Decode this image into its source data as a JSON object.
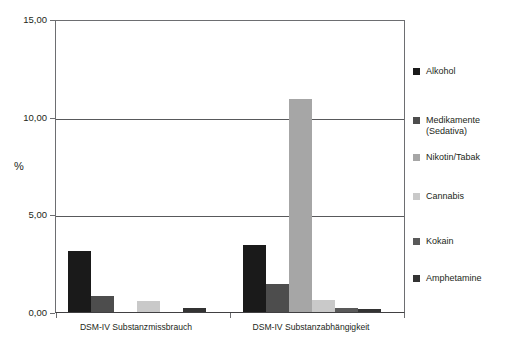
{
  "chart_data": {
    "type": "bar",
    "title": "",
    "xlabel": "",
    "ylabel": "%",
    "ylim": [
      0,
      15
    ],
    "yticks": [
      0,
      5,
      10,
      15
    ],
    "ytick_labels": [
      "0,00",
      "5,00",
      "10,00",
      "15,00"
    ],
    "grid": true,
    "legend_position": "right",
    "categories": [
      "DSM-IV Substanzmissbrauch",
      "DSM-IV Substanzabhängigkeit"
    ],
    "series": [
      {
        "name": "Alkohol",
        "color": "#1a1a1a",
        "values": [
          3.1,
          3.45
        ]
      },
      {
        "name": "Medikamente\n(Sedativa)",
        "color": "#4d4d4d",
        "values": [
          0.8,
          1.45
        ]
      },
      {
        "name": "Nikotin/Tabak",
        "color": "#a6a6a6",
        "values": [
          0.0,
          10.9
        ]
      },
      {
        "name": "Cannabis",
        "color": "#c9c9c9",
        "values": [
          0.55,
          0.6
        ]
      },
      {
        "name": "Kokain",
        "color": "#595959",
        "values": [
          0.0,
          0.22
        ]
      },
      {
        "name": "Amphetamine",
        "color": "#333333",
        "values": [
          0.2,
          0.15
        ]
      }
    ]
  },
  "axis": {
    "y_title": "%",
    "ticks": [
      {
        "label": "15,00",
        "value": 15
      },
      {
        "label": "10,00",
        "value": 10
      },
      {
        "label": "5,00",
        "value": 5
      },
      {
        "label": "0,00",
        "value": 0
      }
    ]
  },
  "legend": {
    "items": [
      {
        "label": "Alkohol",
        "color": "#1a1a1a"
      },
      {
        "label": "Medikamente\n(Sedativa)",
        "color": "#4d4d4d"
      },
      {
        "label": "Nikotin/Tabak",
        "color": "#a6a6a6"
      },
      {
        "label": "Cannabis",
        "color": "#c9c9c9"
      },
      {
        "label": "Kokain",
        "color": "#595959"
      },
      {
        "label": "Amphetamine",
        "color": "#333333"
      }
    ]
  }
}
